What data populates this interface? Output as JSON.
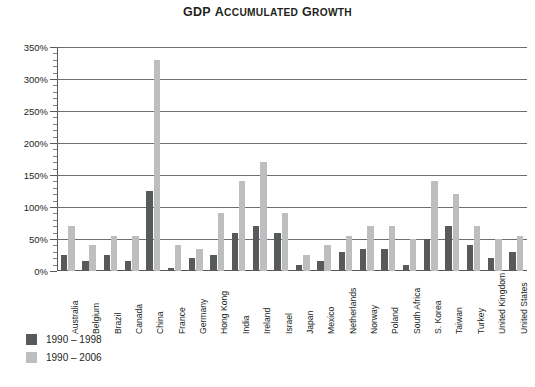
{
  "title": {
    "full": "GDP Accumulated Growth",
    "word1_first": "GDP",
    "word2_first": "A",
    "word2_rest": "CCUMULATED",
    "word3_first": "G",
    "word3_rest": "ROWTH"
  },
  "legend": {
    "items": [
      {
        "label": "1990 – 1998",
        "color": "#58595b",
        "series": "1990-1998"
      },
      {
        "label": "1990 – 2006",
        "color": "#bcbec0",
        "series": "1990-2006"
      }
    ]
  },
  "axis": {
    "y_ticks": [
      "0%",
      "50%",
      "100%",
      "150%",
      "200%",
      "250%",
      "300%",
      "350%"
    ],
    "y_tick_values": [
      0,
      50,
      100,
      150,
      200,
      250,
      300,
      350
    ]
  },
  "chart_data": {
    "type": "bar",
    "xlabel": "",
    "ylabel": "",
    "ylim": [
      0,
      350
    ],
    "ytick_step": 50,
    "grid": true,
    "legend_position": "bottom-left",
    "orientation": "vertical",
    "grouped": true,
    "categories": [
      "Australia",
      "Belgium",
      "Brazil",
      "Canada",
      "China",
      "France",
      "Germany",
      "Hong Kong",
      "India",
      "Ireland",
      "Israel",
      "Japan",
      "Mexico",
      "Netherlands",
      "Norway",
      "Poland",
      "South Africa",
      "S. Korea",
      "Taiwan",
      "Turkey",
      "United Kingdom",
      "United States"
    ],
    "series": [
      {
        "name": "1990 – 1998",
        "color": "#58595b",
        "values": [
          25,
          15,
          25,
          15,
          125,
          5,
          20,
          25,
          60,
          70,
          60,
          10,
          15,
          30,
          35,
          35,
          10,
          50,
          70,
          40,
          20,
          30
        ]
      },
      {
        "name": "1990 – 2006",
        "color": "#bcbec0",
        "values": [
          70,
          40,
          55,
          55,
          330,
          40,
          35,
          90,
          140,
          170,
          90,
          25,
          40,
          55,
          70,
          70,
          50,
          140,
          120,
          70,
          50,
          55
        ]
      }
    ]
  }
}
